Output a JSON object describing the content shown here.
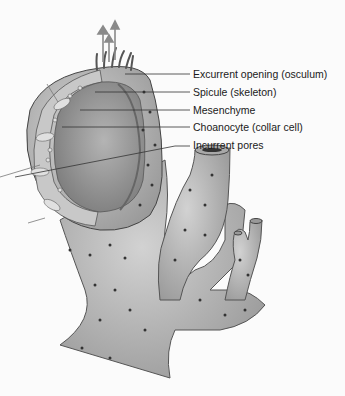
{
  "diagram": {
    "labels": [
      {
        "id": "osculum",
        "text": "Excurrent opening (osculum)"
      },
      {
        "id": "spicule",
        "text": "Spicule (skeleton)"
      },
      {
        "id": "mesenchyme",
        "text": "Mesenchyme"
      },
      {
        "id": "choanocyte",
        "text": "Choanocyte (collar cell)"
      },
      {
        "id": "pores",
        "text": "Incurrent pores"
      }
    ],
    "arrows": {
      "direction": "up",
      "count": 3,
      "meaning": "water outflow"
    },
    "colors": {
      "body": "#b8b8b8",
      "body_dark": "#8a8a8a",
      "cavity": "#9c9c9c",
      "arrow": "#8a8a8a",
      "line": "#333333",
      "pore": "#3a3a3a"
    }
  }
}
